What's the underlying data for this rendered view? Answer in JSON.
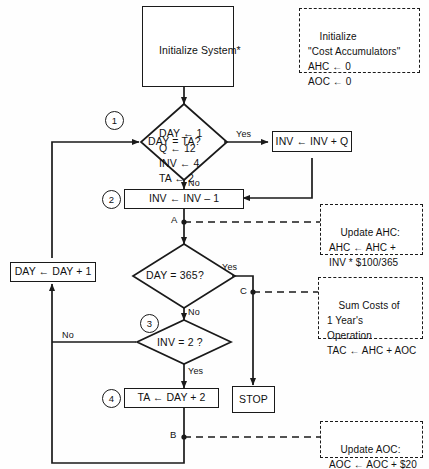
{
  "diagram": {
    "type": "flowchart",
    "colors": {
      "line": "#1a1a1a",
      "background": "#ffffff",
      "text": "#111111"
    },
    "nodes": {
      "initialize_system": {
        "shape": "process",
        "title": "Initialize System*",
        "body": "DAY ← 1\nQ ← 12\nINV ← 4\nTA ← 2"
      },
      "initialize_cost_accumulators": {
        "shape": "dashed-note",
        "text": "Initialize\n\"Cost Accumulators\"\nAHC ← 0\nAOC ← 0"
      },
      "decision_day_eq_ta": {
        "shape": "decision",
        "label": "DAY = TA?",
        "marker": "1",
        "yes_label": "Yes",
        "no_label": "No"
      },
      "inv_plus_q": {
        "shape": "process",
        "text": "INV ← INV + Q"
      },
      "inv_minus_1": {
        "shape": "process",
        "text": "INV ← INV – 1",
        "marker": "2"
      },
      "update_ahc": {
        "shape": "dashed-note",
        "text": "Update AHC:\nAHC ← AHC +\nINV * $100/365"
      },
      "decision_day_eq_365": {
        "shape": "decision",
        "label": "DAY = 365?",
        "yes_label": "Yes",
        "no_label": "No"
      },
      "sum_costs": {
        "shape": "dashed-note",
        "text": "Sum Costs of\n1 Year's\nOperation\nTAC ← AHC + AOC"
      },
      "decision_inv_eq_2": {
        "shape": "decision",
        "label": "INV = 2 ?",
        "marker": "3",
        "yes_label": "Yes",
        "no_label": "No"
      },
      "day_plus_1": {
        "shape": "process",
        "text": "DAY ← DAY + 1"
      },
      "ta_day_plus_2": {
        "shape": "process",
        "text": "TA ← DAY + 2",
        "marker": "4"
      },
      "stop": {
        "shape": "terminal",
        "text": "STOP"
      },
      "update_aoc": {
        "shape": "dashed-note",
        "text": "Update AOC:\nAOC ← AOC + $20"
      }
    },
    "connector_points": {
      "a": "A",
      "b": "B",
      "c": "C"
    },
    "edge_labels": {
      "yes_day_ta": "Yes",
      "no_day_ta": "No",
      "yes_day_365": "Yes",
      "no_day_365": "No",
      "yes_inv_2": "Yes",
      "no_inv_2": "No"
    },
    "markers": {
      "one": "1",
      "two": "2",
      "three": "3",
      "four": "4"
    }
  }
}
